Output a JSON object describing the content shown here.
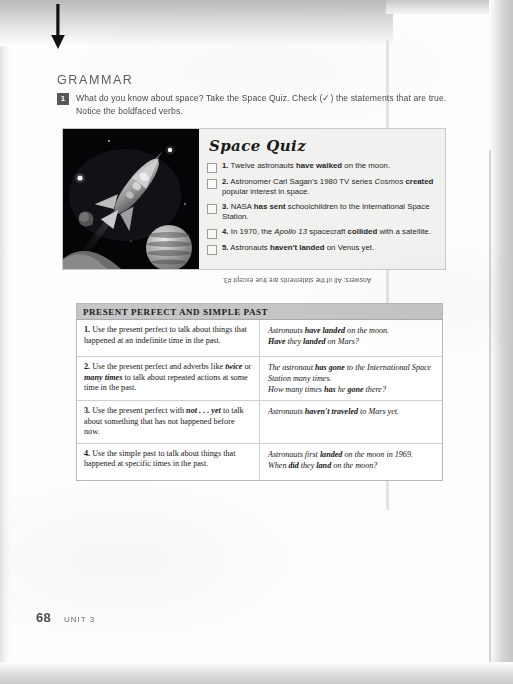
{
  "page": {
    "section_title": "GRAMMAR",
    "folio": "68",
    "unit": "UNIT 3",
    "arrow_icon": "down-arrow-icon"
  },
  "exercise": {
    "number": "1",
    "instruction": "What do you know about space? Take the Space Quiz. Check (✓) the statements that are true. Notice the boldfaced verbs."
  },
  "quiz": {
    "title": "Space Quiz",
    "illustration": "rocket-in-space-illustration",
    "items": [
      {
        "num": "1.",
        "text_html": "Twelve astronauts <b>have walked</b> on the moon."
      },
      {
        "num": "2.",
        "text_html": "Astronomer Carl Sagan's 1980 TV series <i>Cosmos</i> <b>created</b> popular interest in space."
      },
      {
        "num": "3.",
        "text_html": "NASA <b>has sent</b> schoolchildren to the International Space Station."
      },
      {
        "num": "4.",
        "text_html": "In 1970, the <i>Apollo 13</i> spacecraft <b>collided</b> with a satellite."
      },
      {
        "num": "5.",
        "text_html": "Astronauts <b>haven't landed</b> on Venus yet."
      }
    ],
    "answers": "Answers: All of the statements are true except #3."
  },
  "chart": {
    "header": "PRESENT PERFECT AND SIMPLE PAST",
    "rows": [
      {
        "num": "1.",
        "rule_html": "Use the present perfect to talk about things that happened at an indefinite time in the past.",
        "examples_html": [
          "Astronauts <b>have landed</b> on the moon.",
          "<b>Have</b> they <b>landed</b> on Mars?"
        ]
      },
      {
        "num": "2.",
        "rule_html": "Use the present perfect and adverbs like <i>twice</i> or <i>many times</i> to talk about repeated actions at some time in the past.",
        "examples_html": [
          "The astronaut <b>has gone</b> to the International Space Station many times.",
          "How many times <b>has</b> he <b>gone</b> there?"
        ]
      },
      {
        "num": "3.",
        "rule_html": "Use the present perfect with <i>not . . . yet</i> to talk about something that has not happened before now.",
        "examples_html": [
          "Astronauts <b>haven't traveled</b> to Mars yet."
        ]
      },
      {
        "num": "4.",
        "rule_html": "Use the simple past to talk about things that happened at specific times in the past.",
        "examples_html": [
          "Astronauts first <b>landed</b> on the moon in 1969.",
          "When <b>did</b> they <b>land</b> on the moon?"
        ]
      }
    ]
  },
  "colors": {
    "header_band": "#c6c6c6",
    "quiz_background": "#f1f1ef",
    "space_black": "#050507",
    "badge": "#585858"
  }
}
